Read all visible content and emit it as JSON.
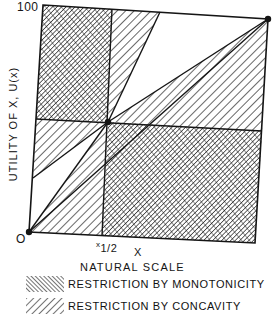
{
  "figure": {
    "y_axis_label": "UTILITY  OF X,  U(x)",
    "x_axis_label": "X",
    "x_scale_label": "NATURAL  SCALE",
    "y_max_tick": "100",
    "origin_label": "O",
    "x_half_label": "x1/2",
    "x_half_prefix": "x",
    "x_half_sub": "1/2",
    "points": [
      "origin (0,0)",
      "midpoint (x1/2, 50)",
      "max (100,100)"
    ],
    "regions": [
      {
        "name": "upper-left",
        "restriction": "monotonicity"
      },
      {
        "name": "lower-right",
        "restriction": "monotonicity"
      },
      {
        "name": "top-wedge",
        "restriction": "concavity"
      },
      {
        "name": "left-wedge",
        "restriction": "concavity"
      },
      {
        "name": "upper-right-wedge",
        "restriction": "concavity"
      },
      {
        "name": "lower-left-wedge",
        "restriction": "concavity"
      }
    ]
  },
  "legend": {
    "items": [
      {
        "pattern": "crosshatch",
        "label": "RESTRICTION BY MONOTONICITY"
      },
      {
        "pattern": "single-hatch",
        "label": "RESTRICTION BY CONCAVITY"
      }
    ]
  },
  "colors": {
    "ink": "#151515",
    "paper": "#ffffff"
  }
}
